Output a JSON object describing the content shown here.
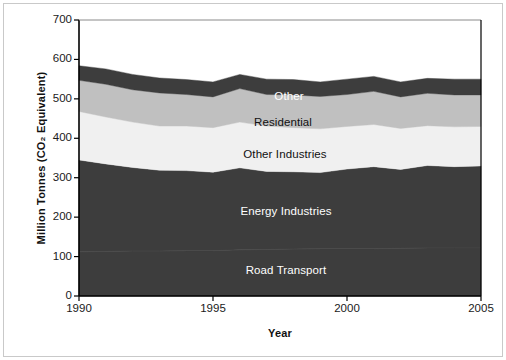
{
  "figure": {
    "background_color": "#ffffff",
    "frame_color": "#c9c9c9",
    "plot_border_color": "#000000"
  },
  "axes": {
    "y_title": "Million Tonnes (CO₂ Equivalent)",
    "x_title": "Year",
    "y_ticks": [
      "0",
      "100",
      "200",
      "300",
      "400",
      "500",
      "600",
      "700"
    ],
    "x_ticks": [
      "1990",
      "1995",
      "2000",
      "2005"
    ]
  },
  "series_labels": [
    {
      "text": "Other",
      "color": "#ffffff",
      "x": 289,
      "y": 96
    },
    {
      "text": "Residential",
      "color": "#111111",
      "x": 283,
      "y": 122
    },
    {
      "text": "Other Industries",
      "color": "#111111",
      "x": 285,
      "y": 154
    },
    {
      "text": "Energy Industries",
      "color": "#ffffff",
      "x": 286,
      "y": 211
    },
    {
      "text": "Road Transport",
      "color": "#ffffff",
      "x": 286,
      "y": 270
    }
  ],
  "chart_data": {
    "type": "area",
    "stacked": true,
    "title": "",
    "xlabel": "Year",
    "ylabel": "Million Tonnes (CO₂ Equivalent)",
    "xlim": [
      1990,
      2005
    ],
    "ylim": [
      0,
      700
    ],
    "y_ticks": [
      0,
      100,
      200,
      300,
      400,
      500,
      600,
      700
    ],
    "x_ticks": [
      1990,
      1995,
      2000,
      2005
    ],
    "grid": false,
    "legend": "inline-labels",
    "x": [
      1990,
      1991,
      1992,
      1993,
      1994,
      1995,
      1996,
      1997,
      1998,
      1999,
      2000,
      2001,
      2002,
      2003,
      2004,
      2005
    ],
    "series": [
      {
        "name": "Road Transport",
        "color": "#3d3d3d",
        "values": [
          112,
          113,
          114,
          114,
          115,
          115,
          117,
          118,
          119,
          120,
          120,
          120,
          121,
          122,
          122,
          122
        ]
      },
      {
        "name": "Energy Industries",
        "color": "#3d3d3d",
        "values": [
          233,
          222,
          212,
          205,
          203,
          199,
          208,
          198,
          196,
          193,
          202,
          208,
          200,
          209,
          206,
          208
        ]
      },
      {
        "name": "Other Industries",
        "color": "#f0f0f0",
        "values": [
          123,
          119,
          115,
          112,
          113,
          113,
          116,
          115,
          112,
          111,
          108,
          107,
          104,
          101,
          101,
          100
        ]
      },
      {
        "name": "Residential",
        "color": "#c0c0c0",
        "values": [
          79,
          83,
          82,
          84,
          80,
          78,
          85,
          80,
          83,
          82,
          81,
          84,
          80,
          82,
          81,
          80
        ]
      },
      {
        "name": "Other",
        "color": "#3d3d3d",
        "values": [
          37,
          39,
          39,
          38,
          38,
          38,
          36,
          39,
          39,
          37,
          39,
          38,
          38,
          38,
          40,
          40
        ]
      }
    ],
    "totals": [
      584,
      576,
      562,
      553,
      549,
      543,
      562,
      550,
      549,
      543,
      550,
      557,
      543,
      552,
      550,
      550
    ]
  }
}
